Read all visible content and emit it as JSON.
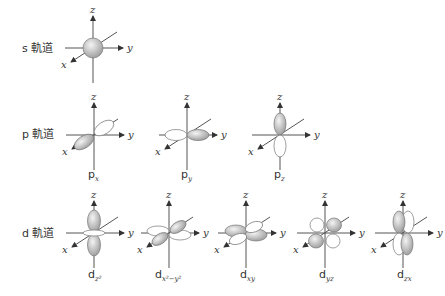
{
  "rows": [
    {
      "id": "s",
      "label": "s 軌道",
      "y": 48
    },
    {
      "id": "p",
      "label": "p 軌道",
      "y": 135
    },
    {
      "id": "d",
      "label": "d 軌道",
      "y": 233
    }
  ],
  "axes": {
    "x": "x",
    "y": "y",
    "z": "z"
  },
  "orbitals": {
    "s": {
      "main": "",
      "sub": ""
    },
    "px": {
      "main": "p",
      "sub": "x"
    },
    "py": {
      "main": "p",
      "sub": "y"
    },
    "pz": {
      "main": "p",
      "sub": "z"
    },
    "dz2": {
      "main": "d",
      "sub": "z²"
    },
    "dx2y2": {
      "main": "d",
      "sub": "x²−y²"
    },
    "dxy": {
      "main": "d",
      "sub": "xy"
    },
    "dyz": {
      "main": "d",
      "sub": "yz"
    },
    "dzx": {
      "main": "d",
      "sub": "zx"
    }
  },
  "colors": {
    "lobe_dark": "#9a9a9a",
    "lobe_light": "#f2f2f2",
    "axis": "#555555"
  }
}
